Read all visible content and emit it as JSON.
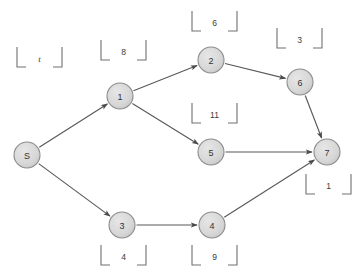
{
  "figure": {
    "type": "directed-graph",
    "background_color": "#ffffff",
    "node_fill": "#d8d8d8",
    "node_stroke": "#8c8c8c",
    "edge_color": "#595959",
    "bracket_color": "#707070",
    "text_color": "#333333"
  },
  "nodes": [
    {
      "id": "S",
      "label": "S",
      "cx": 27,
      "cy": 155,
      "r": 13
    },
    {
      "id": "1",
      "label": "1",
      "cx": 120,
      "cy": 96,
      "r": 13
    },
    {
      "id": "2",
      "label": "2",
      "cx": 211,
      "cy": 60,
      "r": 13
    },
    {
      "id": "6",
      "label": "6",
      "cx": 300,
      "cy": 82,
      "r": 13
    },
    {
      "id": "7",
      "label": "7",
      "cx": 327,
      "cy": 152,
      "r": 13
    },
    {
      "id": "5",
      "label": "5",
      "cx": 211,
      "cy": 152,
      "r": 13
    },
    {
      "id": "3",
      "label": "3",
      "cx": 122,
      "cy": 225,
      "r": 13
    },
    {
      "id": "4",
      "label": "4",
      "cx": 212,
      "cy": 225,
      "r": 13
    }
  ],
  "edges": [
    {
      "from": "S",
      "to": "1"
    },
    {
      "from": "S",
      "to": "3"
    },
    {
      "from": "1",
      "to": "2"
    },
    {
      "from": "1",
      "to": "5"
    },
    {
      "from": "2",
      "to": "6"
    },
    {
      "from": "6",
      "to": "7"
    },
    {
      "from": "5",
      "to": "7"
    },
    {
      "from": "3",
      "to": "4"
    },
    {
      "from": "4",
      "to": "7"
    }
  ],
  "brackets": [
    {
      "key": "t",
      "text": "t",
      "italic": true,
      "x": 17,
      "y": 47,
      "w": 45,
      "h": 20
    },
    {
      "key": "n1",
      "text": "8",
      "italic": false,
      "x": 101,
      "y": 40,
      "w": 45,
      "h": 20
    },
    {
      "key": "n2",
      "text": "6",
      "italic": false,
      "x": 192,
      "y": 11,
      "w": 45,
      "h": 20
    },
    {
      "key": "n6",
      "text": "3",
      "italic": false,
      "x": 277,
      "y": 28,
      "w": 45,
      "h": 20
    },
    {
      "key": "n5",
      "text": "11",
      "italic": false,
      "x": 192,
      "y": 103,
      "w": 45,
      "h": 20
    },
    {
      "key": "n7",
      "text": "1",
      "italic": false,
      "x": 306,
      "y": 174,
      "w": 45,
      "h": 20
    },
    {
      "key": "n3",
      "text": "4",
      "italic": false,
      "x": 101,
      "y": 245,
      "w": 45,
      "h": 20
    },
    {
      "key": "n4",
      "text": "9",
      "italic": false,
      "x": 192,
      "y": 245,
      "w": 45,
      "h": 20
    }
  ]
}
